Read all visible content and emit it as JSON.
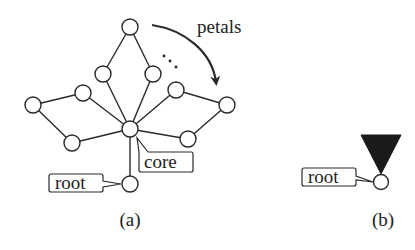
{
  "figure": {
    "panel_a": {
      "caption": "(a)",
      "labels": {
        "petals": "petals",
        "core": "core",
        "root": "root"
      },
      "ellipsis": "⋱",
      "nodes": [
        {
          "id": "top",
          "x": 130,
          "y": 27
        },
        {
          "id": "upper-left-inner",
          "x": 103,
          "y": 74
        },
        {
          "id": "upper-right-inner",
          "x": 153,
          "y": 74
        },
        {
          "id": "left-mid",
          "x": 83,
          "y": 93
        },
        {
          "id": "right-mid",
          "x": 176,
          "y": 90
        },
        {
          "id": "far-left",
          "x": 33,
          "y": 105
        },
        {
          "id": "far-right",
          "x": 227,
          "y": 105
        },
        {
          "id": "lower-left",
          "x": 72,
          "y": 143
        },
        {
          "id": "lower-right",
          "x": 188,
          "y": 139
        },
        {
          "id": "core",
          "x": 130,
          "y": 129
        },
        {
          "id": "root",
          "x": 130,
          "y": 184
        }
      ]
    },
    "panel_b": {
      "caption": "(b)",
      "labels": {
        "root": "root"
      }
    },
    "colors": {
      "stroke": "#2a2a2a",
      "triangle_fill": "#1a1a1a",
      "background": "#ffffff"
    }
  }
}
